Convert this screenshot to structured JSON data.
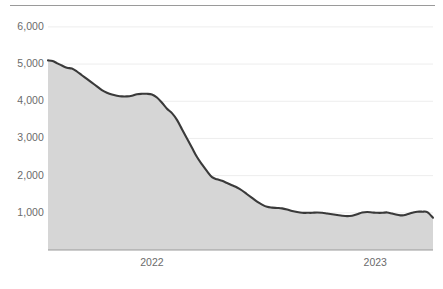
{
  "chart_data": {
    "type": "area",
    "title": "",
    "subtitle": "",
    "xlabel": "",
    "ylabel": "",
    "ylim": [
      0,
      6400
    ],
    "grid": true,
    "legend_position": "none",
    "line_color": "#3a3a3a",
    "fill_color": "#d6d6d6",
    "grid_color": "#ededed",
    "axis_color": "#9a9a9a",
    "tick_label_color": "#6b6b6b",
    "y_ticks": [
      {
        "value": 6000,
        "label": "6,000"
      },
      {
        "value": 5000,
        "label": "5,000"
      },
      {
        "value": 4000,
        "label": "4,000"
      },
      {
        "value": 3000,
        "label": "3,000"
      },
      {
        "value": 2000,
        "label": "2,000"
      },
      {
        "value": 1000,
        "label": "1,000"
      }
    ],
    "x_ticks": [
      {
        "position": 0.27,
        "label": "2022"
      },
      {
        "position": 0.85,
        "label": "2023"
      }
    ],
    "x": [
      0.0,
      0.012,
      0.024,
      0.036,
      0.049,
      0.062,
      0.075,
      0.088,
      0.101,
      0.114,
      0.127,
      0.14,
      0.153,
      0.166,
      0.179,
      0.192,
      0.205,
      0.218,
      0.231,
      0.244,
      0.257,
      0.27,
      0.283,
      0.296,
      0.309,
      0.322,
      0.335,
      0.348,
      0.361,
      0.374,
      0.387,
      0.4,
      0.413,
      0.426,
      0.439,
      0.452,
      0.465,
      0.478,
      0.491,
      0.504,
      0.517,
      0.53,
      0.543,
      0.556,
      0.569,
      0.582,
      0.595,
      0.608,
      0.621,
      0.634,
      0.647,
      0.66,
      0.673,
      0.686,
      0.699,
      0.712,
      0.725,
      0.738,
      0.751,
      0.764,
      0.777,
      0.79,
      0.803,
      0.816,
      0.829,
      0.842,
      0.855,
      0.868,
      0.881,
      0.894,
      0.907,
      0.92,
      0.933,
      0.946,
      0.959,
      0.972,
      0.985,
      1.0
    ],
    "values": [
      5100,
      5080,
      5020,
      4960,
      4900,
      4880,
      4800,
      4700,
      4600,
      4500,
      4400,
      4300,
      4230,
      4180,
      4150,
      4130,
      4130,
      4150,
      4190,
      4200,
      4200,
      4180,
      4100,
      3960,
      3800,
      3680,
      3500,
      3250,
      3000,
      2750,
      2500,
      2300,
      2120,
      1960,
      1900,
      1860,
      1800,
      1740,
      1680,
      1600,
      1500,
      1400,
      1300,
      1220,
      1160,
      1140,
      1130,
      1120,
      1090,
      1050,
      1020,
      1000,
      1000,
      1000,
      1010,
      1000,
      980,
      960,
      940,
      920,
      910,
      920,
      960,
      1010,
      1020,
      1010,
      1000,
      1000,
      1010,
      980,
      950,
      930,
      960,
      1000,
      1030,
      1030,
      1020,
      870
    ]
  }
}
